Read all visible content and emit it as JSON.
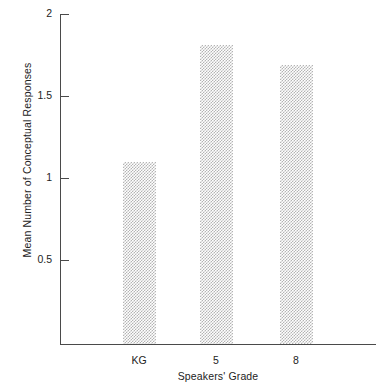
{
  "chart_data": {
    "type": "bar",
    "title": "",
    "subtitle": "",
    "xlabel": "Speakers' Grade",
    "ylabel": "Mean Number of Conceptual Responses",
    "categories": [
      "KG",
      "5",
      "8"
    ],
    "values": [
      1.1,
      1.81,
      1.69
    ],
    "series": [
      {
        "name": "Mean Number of Conceptual Responses",
        "values": [
          1.1,
          1.81,
          1.69
        ]
      }
    ],
    "ylim": [
      0,
      2
    ],
    "xlim_note": "categorical",
    "yticks": [
      0.5,
      1,
      1.5,
      2
    ],
    "ytick_labels": [
      "0.5",
      "1",
      "1.5",
      "2"
    ],
    "xtick_labels": [
      "KG",
      "5",
      "8"
    ],
    "grid": false,
    "legend": false,
    "legend_position": "none",
    "annotations": [],
    "bar_fill": "#b4b4b4",
    "bar_fill_style": "checkerboard-dither",
    "axis_color": "#4a4a4a",
    "background": "#ffffff",
    "text_color": "#232323"
  },
  "axes": {
    "y": {
      "label": "Mean Number of Conceptual Responses",
      "ticks": [
        {
          "value": 2,
          "label": "2"
        },
        {
          "value": 1.5,
          "label": "1.5"
        },
        {
          "value": 1,
          "label": "1"
        },
        {
          "value": 0.5,
          "label": "0.5"
        }
      ]
    },
    "x": {
      "label": "Speakers' Grade",
      "ticks": [
        {
          "label": "KG"
        },
        {
          "label": "5"
        },
        {
          "label": "8"
        }
      ]
    }
  },
  "bars": [
    {
      "category": "KG",
      "value": 1.1
    },
    {
      "category": "5",
      "value": 1.81
    },
    {
      "category": "8",
      "value": 1.69
    }
  ]
}
